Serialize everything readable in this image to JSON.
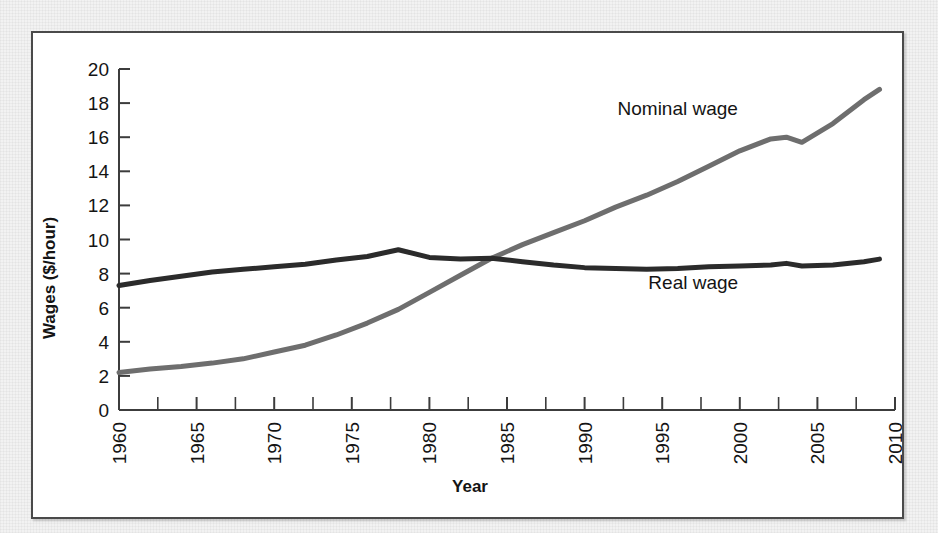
{
  "chart_data": {
    "type": "line",
    "title": "",
    "xlabel": "Year",
    "ylabel": "Wages ($/hour)",
    "xlim": [
      1960,
      2010
    ],
    "ylim": [
      0,
      20
    ],
    "x_ticks": [
      1960,
      1965,
      1970,
      1975,
      1980,
      1985,
      1990,
      1995,
      2000,
      2005,
      2010
    ],
    "x_tick_labels": [
      "1960",
      "1965",
      "1970",
      "1975",
      "1980",
      "1985",
      "1990",
      "1995",
      "2000",
      "2005",
      "2010"
    ],
    "y_ticks": [
      0,
      2,
      4,
      6,
      8,
      10,
      12,
      14,
      16,
      18,
      20
    ],
    "y_tick_labels": [
      "0",
      "2",
      "4",
      "6",
      "8",
      "10",
      "12",
      "14",
      "16",
      "18",
      "20"
    ],
    "grid": false,
    "legend_position": "inline-annotation",
    "x": [
      1960,
      1962,
      1964,
      1966,
      1968,
      1970,
      1972,
      1974,
      1976,
      1978,
      1980,
      1982,
      1984,
      1986,
      1988,
      1990,
      1992,
      1994,
      1996,
      1998,
      2000,
      2002,
      2003,
      2004,
      2006,
      2008,
      2009
    ],
    "series": [
      {
        "name": "Nominal wage",
        "color": "#6e6e6e",
        "stroke_width": 5,
        "label": "Nominal wage",
        "values": [
          2.2,
          2.4,
          2.55,
          2.75,
          3.0,
          3.4,
          3.8,
          4.4,
          5.1,
          5.9,
          6.9,
          7.9,
          8.9,
          9.7,
          10.4,
          11.1,
          11.9,
          12.6,
          13.4,
          14.3,
          15.2,
          15.9,
          16.0,
          15.7,
          16.8,
          18.2,
          18.8
        ]
      },
      {
        "name": "Real wage",
        "color": "#2b2b2b",
        "stroke_width": 5,
        "label": "Real wage",
        "values": [
          7.3,
          7.6,
          7.85,
          8.1,
          8.25,
          8.4,
          8.55,
          8.8,
          9.0,
          9.4,
          8.95,
          8.85,
          8.9,
          8.7,
          8.5,
          8.35,
          8.3,
          8.25,
          8.3,
          8.4,
          8.45,
          8.5,
          8.6,
          8.45,
          8.5,
          8.7,
          8.85
        ]
      }
    ],
    "annotations": [
      {
        "text": "Nominal wage",
        "x": 1996,
        "y": 17.3
      },
      {
        "text": "Real wage",
        "x": 1997,
        "y": 7.1
      }
    ]
  },
  "figure": {
    "frame_border_color": "#4a4a4a",
    "background_color": "#ffffff",
    "margin_color": "#f2f2f2"
  }
}
